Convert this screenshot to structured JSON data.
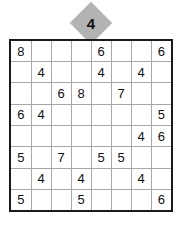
{
  "badge": {
    "label": "4",
    "shape": "diamond",
    "fill_color": "#b3b3b3",
    "text_color": "#111111"
  },
  "grid": {
    "rows": 8,
    "columns": 8,
    "border_color": "#1a1a1a",
    "line_color": "#a8a8a8",
    "digit_color": "#111111",
    "background": "#ffffff",
    "cells": [
      [
        "8",
        "",
        "",
        "",
        "6",
        "",
        "",
        "6"
      ],
      [
        "",
        "4",
        "",
        "",
        "4",
        "",
        "4",
        ""
      ],
      [
        "",
        "",
        "6",
        "8",
        "",
        "7",
        "",
        ""
      ],
      [
        "6",
        "4",
        "",
        "",
        "",
        "",
        "",
        "5"
      ],
      [
        "",
        "",
        "",
        "",
        "",
        "",
        "4",
        "6"
      ],
      [
        "5",
        "",
        "7",
        "",
        "5",
        "5",
        "",
        ""
      ],
      [
        "",
        "4",
        "",
        "4",
        "",
        "",
        "4",
        ""
      ],
      [
        "5",
        "",
        "",
        "5",
        "",
        "",
        "",
        "6"
      ]
    ]
  }
}
